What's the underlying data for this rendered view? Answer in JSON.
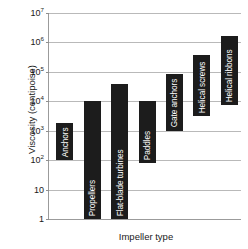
{
  "chart_data": {
    "type": "bar",
    "title": "",
    "xlabel": "Impeller type",
    "ylabel": "Viscosity (centipoise)",
    "yscale": "log",
    "ylim": [
      1,
      10000000
    ],
    "grid": true,
    "legend": "none",
    "orientation": "vertical-floating-range-bars",
    "ytick_labels": [
      "10⁷",
      "10⁶",
      "10⁵",
      "10⁴",
      "10³",
      "10²",
      "10",
      "1"
    ],
    "ytick_values": [
      10000000,
      1000000,
      100000,
      10000,
      1000,
      100,
      10,
      1
    ],
    "ytick_mantissa": [
      "10",
      "10",
      "10",
      "10",
      "10",
      "10",
      "10",
      "1"
    ],
    "ytick_exponent": [
      "7",
      "6",
      "5",
      "4",
      "3",
      "2",
      "",
      ""
    ],
    "categories": [
      "Anchors",
      "Propellers",
      "Flat-blade turbines",
      "Paddles",
      "Gate anchors",
      "Helical screws",
      "Helical ribbons"
    ],
    "bars": [
      {
        "label": "Anchors",
        "low": 100,
        "high": 3000,
        "low_exp": 2.0,
        "high_exp": 3.27
      },
      {
        "label": "Propellers",
        "low": 1,
        "high": 10000,
        "low_exp": 0.0,
        "high_exp": 4.0
      },
      {
        "label": "Flat-blade turbines",
        "low": 1,
        "high": 40000,
        "low_exp": 0.0,
        "high_exp": 4.6
      },
      {
        "label": "Paddles",
        "low": 80,
        "high": 10000,
        "low_exp": 1.9,
        "high_exp": 4.0
      },
      {
        "label": "Gate anchors",
        "low": 1000,
        "high": 800000,
        "low_exp": 3.0,
        "high_exp": 4.93
      },
      {
        "label": "Helical screws",
        "low": 3000,
        "high": 400000,
        "low_exp": 3.5,
        "high_exp": 5.58
      },
      {
        "label": "Helical ribbons",
        "low": 8000,
        "high": 1600000,
        "low_exp": 3.88,
        "high_exp": 6.23
      }
    ],
    "colors": {
      "bar_fill": "#1c1c1c",
      "bar_label_text": "#ffffff",
      "gridline": "#b9b9b9",
      "axis_line": "#9b9b9b",
      "background": "#ffffff",
      "axis_text": "#1a1a1a"
    }
  }
}
